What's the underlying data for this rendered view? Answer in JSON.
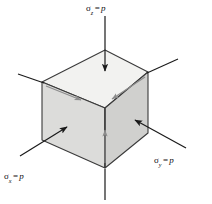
{
  "figure": {
    "type": "mechanics-stress-element-diagram",
    "background_color": "#ffffff"
  },
  "labels": {
    "sigma_z": {
      "symbol": "σ",
      "subscript": "z",
      "equals": "=",
      "value": "p",
      "full_text": "σz = p"
    },
    "sigma_x": {
      "symbol": "σ",
      "subscript": "x",
      "equals": "=",
      "value": "p",
      "full_text": "σx = p"
    },
    "sigma_y": {
      "symbol": "σ",
      "subscript": "y",
      "equals": "=",
      "value": "p",
      "full_text": "σy = p"
    }
  },
  "colors": {
    "top_face": "#f2f2f0",
    "left_face": "#dcdcda",
    "right_face": "#d0d0ce",
    "edge": "#3a3a3a",
    "arrow": "#1a1a1a",
    "inner_arrow": "#8c8c8c",
    "text": "#111111"
  },
  "geometry": {
    "cube": {
      "vertex_top": [
        105,
        50
      ],
      "vertex_left": [
        42,
        82
      ],
      "vertex_right": [
        148,
        72
      ],
      "vertex_front_top": [
        105,
        108
      ],
      "vertex_left_bottom": [
        42,
        140
      ],
      "vertex_right_bottom": [
        148,
        133
      ],
      "vertex_front_bottom": [
        105,
        168
      ],
      "top_face_points": "105,50 42,82 105,108 148,72",
      "left_face_points": "42,82 105,108 105,168 42,140",
      "right_face_points": "105,108 148,72 148,133 105,168"
    },
    "arrows": {
      "sigma_z_top": {
        "from": [
          105,
          16
        ],
        "to": [
          105,
          73
        ],
        "direction": "down"
      },
      "sigma_z_bottom": {
        "from": [
          105,
          200
        ],
        "to": [
          105,
          168
        ],
        "direction": "up-line"
      },
      "sigma_z_inner": {
        "from": [
          105,
          162
        ],
        "to": [
          105,
          128
        ],
        "direction": "up"
      },
      "sigma_x": {
        "from": [
          20,
          156
        ],
        "to": [
          69,
          126
        ],
        "direction": "up-right"
      },
      "sigma_y": {
        "from": [
          186,
          148
        ],
        "to": [
          133,
          119
        ],
        "direction": "up-left"
      },
      "inner_left_edge": {
        "from": [
          45,
          85
        ],
        "to": [
          83,
          101
        ],
        "direction": "right"
      },
      "inner_right_edge": {
        "from": [
          146,
          76
        ],
        "to": [
          110,
          100
        ],
        "direction": "left"
      },
      "leader_upper_left": {
        "from": [
          18,
          74
        ],
        "to": [
          44,
          83
        ]
      },
      "leader_upper_right": {
        "from": [
          178,
          59
        ],
        "to": [
          147,
          73
        ]
      }
    }
  }
}
